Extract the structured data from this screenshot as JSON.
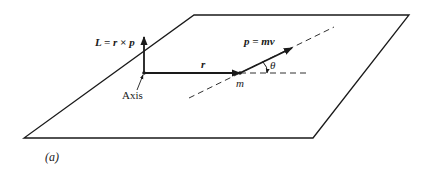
{
  "diagram": {
    "type": "vector diagram - angular momentum",
    "colors": {
      "ink": "#1a1a1a",
      "background": "#ffffff"
    },
    "labels": {
      "angular_momentum": "L = r × p",
      "position_vector": "r",
      "momentum": "p = mv",
      "angle": "θ",
      "mass": "m",
      "axis": "Axis",
      "panel": "(a)"
    },
    "geometry": {
      "plane": [
        [
          194,
          15
        ],
        [
          409,
          15
        ],
        [
          313,
          138
        ],
        [
          24,
          138
        ]
      ],
      "origin": [
        144,
        73
      ],
      "L_tip": [
        144,
        37
      ],
      "r_tip": [
        240,
        73
      ],
      "p_tip": [
        292,
        48
      ],
      "line_of_motion": [
        [
          189,
          98
        ],
        [
          334,
          27
        ]
      ],
      "reference_dash": [
        [
          240,
          73
        ],
        [
          307,
          73
        ]
      ]
    }
  }
}
